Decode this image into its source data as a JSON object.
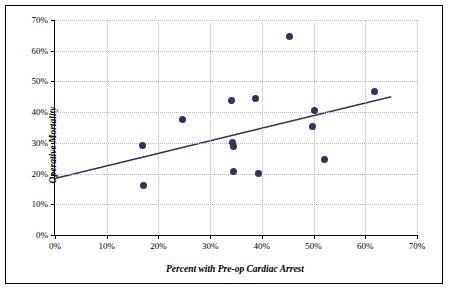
{
  "chart_data": {
    "type": "scatter",
    "title": "",
    "xlabel": "Percent with Pre-op Cardiac Arrest",
    "ylabel": "Operative Mortality",
    "xlim": [
      0,
      70
    ],
    "ylim": [
      0,
      70
    ],
    "xticks": [
      "0%",
      "10%",
      "20%",
      "30%",
      "40%",
      "50%",
      "60%",
      "70%"
    ],
    "xtick_values": [
      0,
      10,
      20,
      30,
      40,
      50,
      60,
      70
    ],
    "yticks": [
      "0%",
      "10%",
      "20%",
      "30%",
      "40%",
      "50%",
      "60%",
      "70%"
    ],
    "ytick_values": [
      0,
      10,
      20,
      30,
      40,
      50,
      60,
      70
    ],
    "grid": true,
    "legend": false,
    "marker_color": "#32325a",
    "trendline_color": "#32325a",
    "points": [
      {
        "x": 17.0,
        "y": 29.3
      },
      {
        "x": 17.2,
        "y": 16.0
      },
      {
        "x": 24.6,
        "y": 37.7
      },
      {
        "x": 34.2,
        "y": 43.8
      },
      {
        "x": 34.3,
        "y": 30.0
      },
      {
        "x": 34.6,
        "y": 28.9
      },
      {
        "x": 34.6,
        "y": 20.8
      },
      {
        "x": 38.8,
        "y": 44.3
      },
      {
        "x": 39.3,
        "y": 20.1
      },
      {
        "x": 45.3,
        "y": 64.6
      },
      {
        "x": 49.7,
        "y": 35.2
      },
      {
        "x": 50.2,
        "y": 40.4
      },
      {
        "x": 52.1,
        "y": 24.7
      },
      {
        "x": 61.7,
        "y": 46.8
      }
    ],
    "trendline": {
      "x_start": 0,
      "y_start": 18.4,
      "x_end": 65.0,
      "y_end": 45.0
    }
  }
}
